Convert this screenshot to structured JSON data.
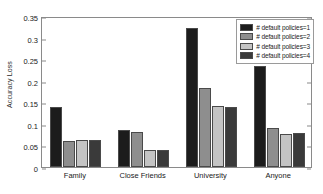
{
  "chart_data": {
    "type": "bar",
    "title": "",
    "xlabel": "",
    "ylabel": "Accuracy Loss",
    "categories": [
      "Family",
      "Close Friends",
      "University",
      "Anyone"
    ],
    "series": [
      {
        "name": "# default policies=1",
        "color": "#1c1c1c",
        "values": [
          0.14,
          0.086,
          0.323,
          0.235
        ]
      },
      {
        "name": "# default policies=2",
        "color": "#8e8e8e",
        "values": [
          0.06,
          0.081,
          0.183,
          0.09
        ]
      },
      {
        "name": "# default policies=3",
        "color": "#c4c4c4",
        "values": [
          0.062,
          0.039,
          0.141,
          0.076
        ]
      },
      {
        "name": "# default policies=4",
        "color": "#3a3a3a",
        "values": [
          0.062,
          0.039,
          0.139,
          0.078
        ]
      }
    ],
    "ylim": [
      0,
      0.35
    ],
    "yticks": [
      0,
      0.05,
      0.1,
      0.15,
      0.2,
      0.25,
      0.3,
      0.35
    ],
    "ytick_labels": [
      "0",
      "0.05",
      "0.1",
      "0.15",
      "0.2",
      "0.25",
      "0.3",
      "0.35"
    ],
    "grid": false,
    "legend_position": "top-right",
    "axis_color": "#8a8a8a",
    "bar_edge_color": "#4a4a4a",
    "background": "#ffffff"
  }
}
